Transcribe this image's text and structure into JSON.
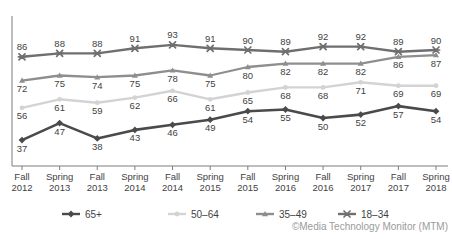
{
  "credit": "©Media Technology Monitor (MTM)",
  "title_sliver": "",
  "chart_data": {
    "type": "line",
    "title": "",
    "subtitle": "",
    "xlabel": "",
    "ylabel": "",
    "ylim": [
      30,
      100
    ],
    "grid": false,
    "legend_position": "bottom",
    "categories": [
      "Fall 2012",
      "Spring 2013",
      "Fall 2013",
      "Spring 2014",
      "Fall 2014",
      "Spring 2015",
      "Fall 2015",
      "Spring 2016",
      "Fall 2016",
      "Spring 2017",
      "Fall 2017",
      "Spring 2018"
    ],
    "category_lines": [
      [
        "Fall",
        "2012"
      ],
      [
        "Spring",
        "2013"
      ],
      [
        "Fall",
        "2013"
      ],
      [
        "Spring",
        "2014"
      ],
      [
        "Fall",
        "2014"
      ],
      [
        "Spring",
        "2015"
      ],
      [
        "Fall",
        "2015"
      ],
      [
        "Spring",
        "2016"
      ],
      [
        "Fall",
        "2016"
      ],
      [
        "Spring",
        "2017"
      ],
      [
        "Fall",
        "2017"
      ],
      [
        "Spring",
        "2018"
      ]
    ],
    "series": [
      {
        "name": "65+",
        "color": "#4a4a4a",
        "marker": "diamond",
        "width": 2.6,
        "values": [
          37,
          47,
          38,
          43,
          46,
          49,
          54,
          55,
          50,
          52,
          57,
          54
        ],
        "label_side": [
          "below",
          "below",
          "below",
          "below",
          "below",
          "below",
          "below",
          "below",
          "below",
          "below",
          "below",
          "below"
        ]
      },
      {
        "name": "50–64",
        "color": "#d3d3d3",
        "marker": "circle",
        "width": 2.4,
        "values": [
          56,
          61,
          59,
          62,
          66,
          61,
          65,
          68,
          68,
          71,
          69,
          69
        ],
        "label_side": [
          "below",
          "below",
          "below",
          "below",
          "below",
          "below",
          "below",
          "below",
          "below",
          "below",
          "below",
          "below"
        ]
      },
      {
        "name": "35–49",
        "color": "#8e8e8e",
        "marker": "triangle",
        "width": 2.3,
        "values": [
          72,
          75,
          74,
          75,
          78,
          75,
          80,
          82,
          82,
          82,
          86,
          87
        ],
        "label_side": [
          "below",
          "below",
          "below",
          "below",
          "below",
          "below",
          "below",
          "below",
          "below",
          "below",
          "below",
          "below"
        ]
      },
      {
        "name": "18–34",
        "color": "#6f6f6f",
        "marker": "cross",
        "width": 2.4,
        "values": [
          86,
          88,
          88,
          91,
          93,
          91,
          90,
          89,
          92,
          92,
          89,
          90
        ],
        "label_side": [
          "above",
          "above",
          "above",
          "above",
          "above",
          "above",
          "above",
          "above",
          "above",
          "above",
          "above",
          "above"
        ]
      }
    ],
    "legend": [
      {
        "label": "65+",
        "color": "#4a4a4a",
        "marker": "diamond"
      },
      {
        "label": "50–64",
        "color": "#d3d3d3",
        "marker": "circle"
      },
      {
        "label": "35–49",
        "color": "#8e8e8e",
        "marker": "triangle"
      },
      {
        "label": "18–34",
        "color": "#6f6f6f",
        "marker": "cross"
      }
    ]
  }
}
